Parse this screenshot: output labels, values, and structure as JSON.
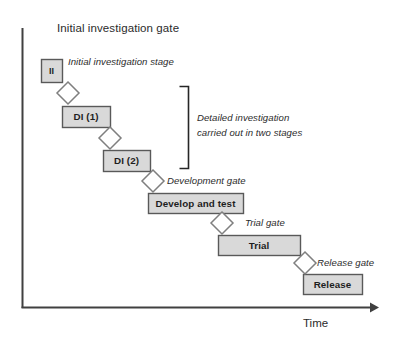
{
  "diagram": {
    "title": "Initial investigation gate",
    "axis": {
      "x_label": "Time",
      "y_label": ""
    },
    "bracket_note": {
      "line1": "Detailed investigation",
      "line2": "carried out in two stages"
    },
    "stages": [
      {
        "id": "ii",
        "label": "II",
        "x": 41,
        "y": 59,
        "w": 21,
        "h": 23
      },
      {
        "id": "di1",
        "label": "DI (1)",
        "x": 62,
        "y": 106,
        "w": 48,
        "h": 21
      },
      {
        "id": "di2",
        "label": "DI (2)",
        "x": 103,
        "y": 150,
        "w": 47,
        "h": 21
      },
      {
        "id": "develop-test",
        "label": "Develop and test",
        "x": 148,
        "y": 193,
        "w": 95,
        "h": 20
      },
      {
        "id": "trial",
        "label": "Trial",
        "x": 218,
        "y": 235,
        "w": 82,
        "h": 20
      },
      {
        "id": "release",
        "label": "Release",
        "x": 303,
        "y": 274,
        "w": 59,
        "h": 20
      }
    ],
    "gates": [
      {
        "id": "initial-investigation-gate",
        "label": "",
        "cx": 68,
        "cy": 93,
        "r": 11
      },
      {
        "id": "detailed-investigation-1",
        "label": "",
        "cx": 110,
        "cy": 138,
        "r": 11
      },
      {
        "id": "development-gate",
        "label": "Development gate",
        "cx": 153,
        "cy": 181,
        "r": 11
      },
      {
        "id": "trial-gate",
        "label": "Trial gate",
        "cx": 222,
        "cy": 223,
        "r": 11
      },
      {
        "id": "release-gate",
        "label": "Release gate",
        "cx": 305,
        "cy": 263,
        "r": 11
      }
    ],
    "annotations": {
      "initial_stage": "Initial investigation stage",
      "development_gate": "Development gate",
      "trial_gate": "Trial gate",
      "release_gate": "Release gate"
    },
    "colors": {
      "box_fill": "#d9d9d9",
      "box_stroke": "#595959",
      "diamond_fill": "#ffffff",
      "diamond_stroke": "#7f7f7f",
      "axis": "#404040",
      "bracket": "#262626",
      "text": "#2b2b2b"
    }
  }
}
